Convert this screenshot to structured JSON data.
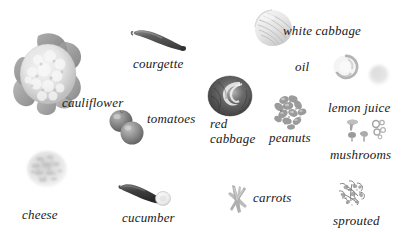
{
  "figure": {
    "background_color": "#ffffff",
    "label_color": "#1a1a1a",
    "style": "grayscale photographic food items with italic serif labels",
    "width": 415,
    "height": 232
  },
  "items": [
    {
      "id": "cauliflower",
      "label": "cauliflower",
      "icon": "cauliflower-icon",
      "item_x": 8,
      "item_y": 28,
      "item_w": 82,
      "item_h": 88,
      "label_x": 62,
      "label_y": 96,
      "font_size": 13,
      "color": "#9a9a9a"
    },
    {
      "id": "courgette",
      "label": "courgette",
      "icon": "courgette-icon",
      "item_x": 130,
      "item_y": 26,
      "item_w": 58,
      "item_h": 26,
      "label_x": 133,
      "label_y": 57,
      "font_size": 13,
      "color": "#6d6d6d"
    },
    {
      "id": "tomatoes",
      "label": "tomatoes",
      "icon": "tomatoes-icon",
      "item_x": 108,
      "item_y": 108,
      "item_w": 40,
      "item_h": 38,
      "label_x": 147,
      "label_y": 112,
      "font_size": 13,
      "color": "#8f8f8f"
    },
    {
      "id": "white-cabbage",
      "label": "white cabbage",
      "icon": "white-cabbage-icon",
      "item_x": 252,
      "item_y": 8,
      "item_w": 42,
      "item_h": 40,
      "label_x": 283,
      "label_y": 24,
      "font_size": 13,
      "color": "#cfcfcf"
    },
    {
      "id": "oil",
      "label": "oil",
      "icon": "oil-icon",
      "item_x": 330,
      "item_y": 52,
      "item_w": 30,
      "item_h": 30,
      "label_x": 295,
      "label_y": 60,
      "font_size": 13,
      "color": "#d8d8d8"
    },
    {
      "id": "lemon-juice",
      "label": "lemon juice",
      "icon": "lemon-juice-icon",
      "item_x": 366,
      "item_y": 62,
      "item_w": 26,
      "item_h": 26,
      "label_x": 328,
      "label_y": 101,
      "font_size": 13,
      "color": "#e2e2e2"
    },
    {
      "id": "red-cabbage",
      "label": "red cabbage",
      "label_line1": "red",
      "label_line2": "cabbage",
      "icon": "red-cabbage-icon",
      "item_x": 206,
      "item_y": 74,
      "item_w": 48,
      "item_h": 44,
      "label_x": 210,
      "label_y": 117,
      "font_size": 13,
      "color": "#5d5d5d"
    },
    {
      "id": "peanuts",
      "label": "peanuts",
      "icon": "peanuts-icon",
      "item_x": 270,
      "item_y": 92,
      "item_w": 40,
      "item_h": 38,
      "label_x": 269,
      "label_y": 131,
      "font_size": 13,
      "color": "#a8a8a8"
    },
    {
      "id": "mushrooms",
      "label": "mushrooms",
      "icon": "mushrooms-icon",
      "item_x": 345,
      "item_y": 118,
      "item_w": 44,
      "item_h": 30,
      "label_x": 330,
      "label_y": 148,
      "font_size": 13,
      "color": "#b5b5b5"
    },
    {
      "id": "cheese",
      "label": "cheese",
      "icon": "cheese-icon",
      "item_x": 22,
      "item_y": 148,
      "item_w": 50,
      "item_h": 42,
      "label_x": 22,
      "label_y": 208,
      "font_size": 13,
      "color": "#dcdcdc"
    },
    {
      "id": "cucumber",
      "label": "cucumber",
      "icon": "cucumber-icon",
      "item_x": 118,
      "item_y": 182,
      "item_w": 56,
      "item_h": 24,
      "label_x": 122,
      "label_y": 211,
      "font_size": 13,
      "color": "#4c4c4c"
    },
    {
      "id": "carrots",
      "label": "carrots",
      "icon": "carrots-icon",
      "item_x": 226,
      "item_y": 184,
      "item_w": 26,
      "item_h": 30,
      "label_x": 253,
      "label_y": 191,
      "font_size": 13,
      "color": "#b0b0b0"
    },
    {
      "id": "sprouted",
      "label": "sprouted",
      "icon": "sprouted-icon",
      "item_x": 335,
      "item_y": 178,
      "item_w": 36,
      "item_h": 32,
      "label_x": 333,
      "label_y": 214,
      "font_size": 13,
      "color": "#909090"
    }
  ]
}
